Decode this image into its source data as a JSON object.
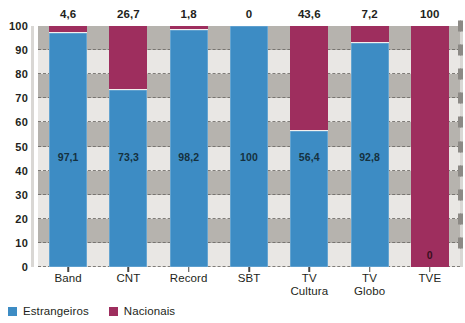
{
  "chart_data": {
    "type": "bar",
    "subtype": "stacked-percentage",
    "title": "",
    "subtitle": "",
    "xlabel": "",
    "ylabel": "",
    "ylim": [
      0,
      100
    ],
    "ytick_step": 10,
    "yticks": [
      "0",
      "10",
      "20",
      "30",
      "40",
      "50",
      "60",
      "70",
      "80",
      "90",
      "100"
    ],
    "grid": true,
    "grid_style": "dashed horizontal bands",
    "legend_position": "bottom-left",
    "categories": [
      "Band",
      "CNT",
      "Record",
      "SBT",
      "TV Cultura",
      "TV Globo",
      "TVE"
    ],
    "category_lines": [
      [
        "Band"
      ],
      [
        "CNT"
      ],
      [
        "Record"
      ],
      [
        "SBT"
      ],
      [
        "TV",
        "Cultura"
      ],
      [
        "TV",
        "Globo"
      ],
      [
        "TVE"
      ]
    ],
    "series": [
      {
        "name": "Estrangeiros",
        "color": "#3d8cc4",
        "values": [
          97.1,
          73.3,
          98.2,
          100,
          56.4,
          92.8,
          0
        ],
        "labels": [
          "97,1",
          "73,3",
          "98,2",
          "100",
          "56,4",
          "92,8",
          "0"
        ]
      },
      {
        "name": "Nacionais",
        "color": "#9e2e5e",
        "values": [
          4.6,
          26.7,
          1.8,
          0,
          43.6,
          7.2,
          100
        ],
        "labels": [
          "4,6",
          "26,7",
          "1,8",
          "0",
          "43,6",
          "7,2",
          "100"
        ]
      }
    ],
    "top_labels": [
      "4,6",
      "26,7",
      "1,8",
      "0",
      "43,6",
      "7,2",
      "100"
    ],
    "colors": {
      "estrangeiros": "#3d8cc4",
      "nacionais": "#9e2e5e",
      "band_light": "#e9e7e4",
      "band_dark": "#b6b3ae",
      "gridline": "#6d6a66",
      "text": "#231f20"
    }
  },
  "legend": {
    "items": [
      {
        "label": "Estrangeiros",
        "color": "#3d8cc4"
      },
      {
        "label": "Nacionais",
        "color": "#9e2e5e"
      }
    ]
  }
}
